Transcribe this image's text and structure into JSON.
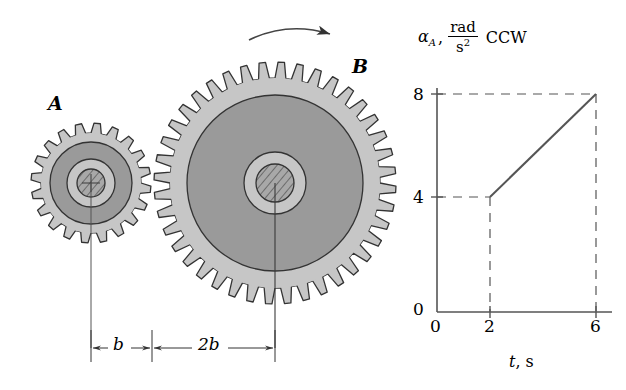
{
  "figure": {
    "title_none": "",
    "gears": [
      {
        "id": "A",
        "label": "A",
        "label_x": 48,
        "label_y": 92,
        "cx": 91,
        "cy": 183,
        "outer_radius": 60,
        "root_radius": 50,
        "disc_radius": 41,
        "inner_ring_radius": 24,
        "hub_radius": 14,
        "teeth": 20,
        "rim_color": "#c6c6c6",
        "disc_color": "#9a9a9a",
        "ring_color": "#c6c6c6",
        "hub_color": "#a8a8a8",
        "outline_color": "#333333"
      },
      {
        "id": "B",
        "label": "B",
        "label_x": 352,
        "label_y": 55,
        "cx": 275,
        "cy": 183,
        "outer_radius": 121,
        "root_radius": 105,
        "disc_radius": 88,
        "inner_ring_radius": 31,
        "hub_radius": 19,
        "teeth": 40,
        "rim_color": "#c6c6c6",
        "disc_color": "#9a9a9a",
        "ring_color": "#c6c6c6",
        "hub_color": "#a8a8a8",
        "outline_color": "#333333"
      }
    ],
    "rotation_arrow": {
      "name": "rotation-direction-arrow",
      "direction": "clockwise-right"
    },
    "dimensions": {
      "line_y": 348,
      "left_tick_x": 91,
      "mid_tick_x": 152,
      "right_tick_x": 275,
      "segments": [
        {
          "label": "b",
          "label_x": 113,
          "label_y": 336
        },
        {
          "label": "2b",
          "label_x": 200,
          "label_y": 336
        }
      ]
    }
  },
  "plot": {
    "axis_label_y": {
      "symbol": "α",
      "subscript": "A",
      "comma": ",",
      "numerator": "rad",
      "denominator": "s",
      "denominator_exponent": "2",
      "sense": "CCW"
    },
    "axis_label_x": {
      "symbol": "t",
      "comma_unit": ", s"
    },
    "y_ticks": [
      "0",
      "4",
      "8"
    ],
    "x_ticks": [
      "0",
      "2",
      "6"
    ],
    "origin_label": "0"
  },
  "chart_data": {
    "type": "line",
    "title": "",
    "xlabel": "t, s",
    "ylabel": "α_A, rad/s² CCW",
    "xlim": [
      0,
      6.6
    ],
    "ylim": [
      0,
      9
    ],
    "xticks": [
      0,
      2,
      6
    ],
    "yticks": [
      0,
      4,
      8
    ],
    "grid": false,
    "legend": "none",
    "series": [
      {
        "name": "alpha_A",
        "x": [
          2,
          6
        ],
        "y": [
          4,
          8
        ],
        "style": "solid",
        "color": "#555555"
      }
    ],
    "guides": [
      {
        "type": "hline",
        "y": 4,
        "from_x": 0,
        "to_x": 2,
        "style": "dashed"
      },
      {
        "type": "hline",
        "y": 8,
        "from_x": 0,
        "to_x": 6,
        "style": "dashed"
      },
      {
        "type": "vline",
        "x": 2,
        "from_y": 0,
        "to_y": 4,
        "style": "dashed"
      },
      {
        "type": "vline",
        "x": 6,
        "from_y": 0,
        "to_y": 8,
        "style": "dashed"
      }
    ],
    "annotations": []
  }
}
